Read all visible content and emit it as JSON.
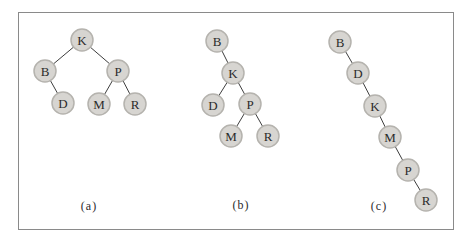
{
  "figure": {
    "type": "binary-tree-diagram",
    "style": {
      "node_radius": 11,
      "node_fill": "#d7d5d1",
      "node_stroke": "#b5b3ae",
      "node_text_color": "#2b2b2b",
      "edge_color": "#3d3d3d",
      "frame_border_color": "#8a8a8a",
      "background": "#ffffff"
    },
    "panels": [
      {
        "label": "(a)",
        "nodes": [
          {
            "id": "K",
            "x": 82,
            "y": 40
          },
          {
            "id": "B",
            "x": 45,
            "y": 71
          },
          {
            "id": "P",
            "x": 118,
            "y": 71
          },
          {
            "id": "D",
            "x": 63,
            "y": 103
          },
          {
            "id": "M",
            "x": 99,
            "y": 104
          },
          {
            "id": "R",
            "x": 135,
            "y": 104
          }
        ],
        "edges": [
          [
            "K",
            "B"
          ],
          [
            "K",
            "P"
          ],
          [
            "B",
            "D"
          ],
          [
            "P",
            "M"
          ],
          [
            "P",
            "R"
          ]
        ]
      },
      {
        "label": "(b)",
        "nodes": [
          {
            "id": "B",
            "x": 217,
            "y": 41
          },
          {
            "id": "K",
            "x": 233,
            "y": 73
          },
          {
            "id": "D",
            "x": 213,
            "y": 105
          },
          {
            "id": "P",
            "x": 250,
            "y": 104
          },
          {
            "id": "M",
            "x": 231,
            "y": 136
          },
          {
            "id": "R",
            "x": 268,
            "y": 136
          }
        ],
        "edges": [
          [
            "B",
            "K"
          ],
          [
            "K",
            "D"
          ],
          [
            "K",
            "P"
          ],
          [
            "P",
            "M"
          ],
          [
            "P",
            "R"
          ]
        ]
      },
      {
        "label": "(c)",
        "nodes": [
          {
            "id": "B",
            "x": 340,
            "y": 42
          },
          {
            "id": "D",
            "x": 358,
            "y": 73
          },
          {
            "id": "K",
            "x": 375,
            "y": 106
          },
          {
            "id": "M",
            "x": 390,
            "y": 137
          },
          {
            "id": "P",
            "x": 408,
            "y": 170
          },
          {
            "id": "R",
            "x": 426,
            "y": 200
          }
        ],
        "edges": [
          [
            "B",
            "D"
          ],
          [
            "D",
            "K"
          ],
          [
            "K",
            "M"
          ],
          [
            "M",
            "P"
          ],
          [
            "P",
            "R"
          ]
        ]
      }
    ]
  }
}
